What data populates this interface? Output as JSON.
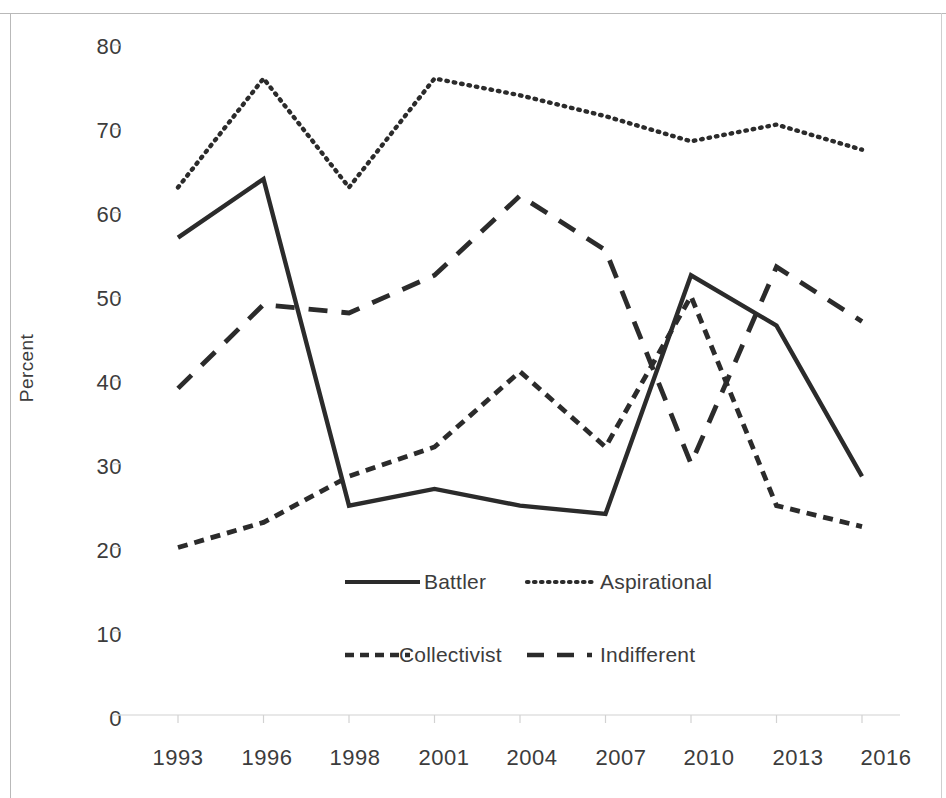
{
  "chart_data": {
    "type": "line",
    "title": "",
    "xlabel": "",
    "ylabel": "Percent",
    "categories": [
      "1993",
      "1996",
      "1998",
      "2001",
      "2004",
      "2007",
      "2010",
      "2013",
      "2016"
    ],
    "ylim": [
      0,
      80
    ],
    "ytick_step": 10,
    "yticks": [
      "0",
      "10",
      "20",
      "30",
      "40",
      "50",
      "60",
      "70",
      "80"
    ],
    "grid": false,
    "legend_position": "inside-bottom-center",
    "series": [
      {
        "name": "Battler",
        "style": "solid",
        "color": "#2b2b2b",
        "values": [
          57,
          64,
          25,
          27,
          25,
          24,
          52.5,
          46.5,
          28.5
        ]
      },
      {
        "name": "Aspirational",
        "style": "dotted",
        "color": "#2b2b2b",
        "values": [
          63,
          76,
          63,
          76,
          74,
          71.5,
          68.5,
          70.5,
          67.5
        ]
      },
      {
        "name": "Collectivist",
        "style": "short-dashed",
        "color": "#2b2b2b",
        "values": [
          20,
          23,
          28.5,
          32,
          41,
          32,
          50,
          25,
          22.5
        ]
      },
      {
        "name": "Indifferent",
        "style": "long-dashed",
        "color": "#2b2b2b",
        "values": [
          39,
          49,
          48,
          52.5,
          62,
          55.5,
          30,
          53.5,
          47
        ]
      }
    ]
  },
  "axis": {
    "y_title": "Percent",
    "y_ticks": [
      "80",
      "70",
      "60",
      "50",
      "40",
      "30",
      "20",
      "10",
      "0"
    ],
    "x_ticks": [
      "1993",
      "1996",
      "1998",
      "2001",
      "2004",
      "2007",
      "2010",
      "2013",
      "2016"
    ]
  },
  "legend": {
    "entries": [
      {
        "label": "Battler",
        "style": "solid"
      },
      {
        "label": "Aspirational",
        "style": "dotted"
      },
      {
        "label": "Collectivist",
        "style": "short-dashed"
      },
      {
        "label": "Indifferent",
        "style": "long-dashed"
      }
    ]
  }
}
